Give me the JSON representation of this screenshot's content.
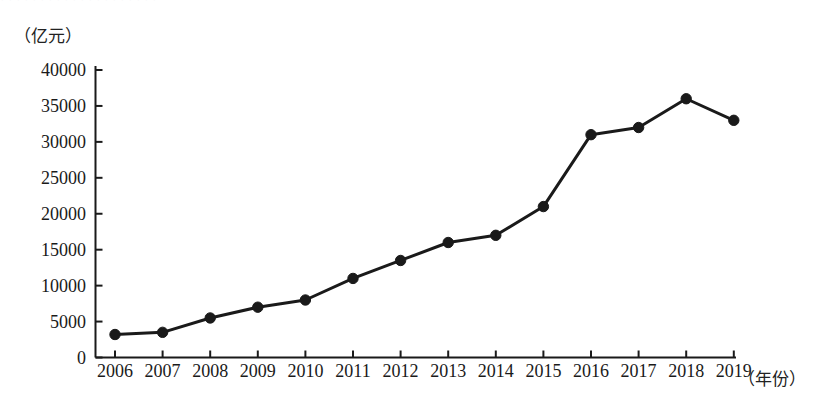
{
  "chart_data": {
    "type": "line",
    "title": "",
    "subtitle": "",
    "xlabel": "（年份）",
    "ylabel": "（亿元）",
    "categories": [
      "2006",
      "2007",
      "2008",
      "2009",
      "2010",
      "2011",
      "2012",
      "2013",
      "2014",
      "2015",
      "2016",
      "2017",
      "2018",
      "2019"
    ],
    "values": [
      3200,
      3500,
      5500,
      7000,
      8000,
      11000,
      13500,
      16000,
      17000,
      21000,
      31000,
      32000,
      36000,
      33000
    ],
    "series": [
      {
        "name": "",
        "values": [
          3200,
          3500,
          5500,
          7000,
          8000,
          11000,
          13500,
          16000,
          17000,
          21000,
          31000,
          32000,
          36000,
          33000
        ]
      }
    ],
    "x": [
      "2006",
      "2007",
      "2008",
      "2009",
      "2010",
      "2011",
      "2012",
      "2013",
      "2014",
      "2015",
      "2016",
      "2017",
      "2018",
      "2019"
    ],
    "ylim": [
      0,
      40000
    ],
    "yticks": [
      "0",
      "5000",
      "10000",
      "15000",
      "20000",
      "25000",
      "30000",
      "35000",
      "40000"
    ],
    "ytick_values": [
      0,
      5000,
      10000,
      15000,
      20000,
      25000,
      30000,
      35000,
      40000
    ],
    "grid": false,
    "legend": null,
    "legend_position": "none",
    "annotations": [],
    "marker": "filled-circle",
    "line_color": "#1a1a1a",
    "marker_color": "#1a1a1a",
    "background_color": "#ffffff"
  },
  "axes": {
    "y_unit_caption": "（亿元）",
    "x_unit_caption": "（年份）"
  },
  "scan": {
    "top_remnant_text": "，，，，，，，，，，，，，，，，，，，，"
  }
}
